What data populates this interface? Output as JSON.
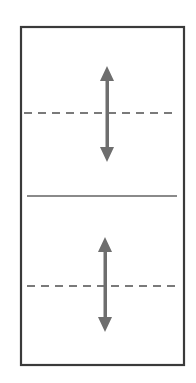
{
  "diagram": {
    "colors": {
      "background": "#ffffff",
      "frame": "#3a3a3a",
      "divider": "#8a8a8a",
      "dashed_line": "#7a7a7a",
      "arrow": "#6e6e6e"
    },
    "frame": {
      "x": 21,
      "y": 27,
      "width": 163,
      "height": 338
    },
    "divider": {
      "x1": 27,
      "x2": 177,
      "y": 196
    },
    "sections": [
      {
        "name": "upper",
        "dashed_line": {
          "x1": 24,
          "x2": 176,
          "y": 113
        },
        "arrow": {
          "x": 107,
          "y_top": 66,
          "y_bottom": 162
        }
      },
      {
        "name": "lower",
        "dashed_line": {
          "x1": 27,
          "x2": 178,
          "y": 286
        },
        "arrow": {
          "x": 105,
          "y_top": 237,
          "y_bottom": 332
        }
      }
    ]
  }
}
